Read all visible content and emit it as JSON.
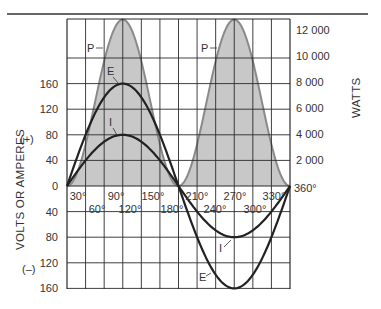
{
  "chart_data": {
    "type": "line",
    "title": "",
    "xlabel": "",
    "ylabel": "VOLTS OR AMPERES",
    "ylabel_right": "WATTS",
    "sign_labels": {
      "positive": "(+)",
      "negative": "(–)"
    },
    "x_unit": "°",
    "x": [
      0,
      30,
      60,
      90,
      120,
      150,
      180,
      210,
      240,
      270,
      300,
      330,
      360
    ],
    "x_tick_labels": [
      "30°",
      "60°",
      "90°",
      "120°",
      "150°",
      "180°",
      "210°",
      "240°",
      "270°",
      "300°",
      "330°",
      "360°"
    ],
    "xlim": [
      0,
      360
    ],
    "ylim_left": [
      -160,
      160
    ],
    "left_tick_labels_positive": [
      "160",
      "120",
      "80",
      "40",
      "0"
    ],
    "left_tick_labels_negative": [
      "40",
      "80",
      "120",
      "160"
    ],
    "ylim_right": [
      0,
      12800
    ],
    "right_tick_labels": [
      "12 000",
      "10 000",
      "8 000",
      "6 000",
      "4 000",
      "2 000"
    ],
    "grid": true,
    "series": [
      {
        "name": "E",
        "label": "E",
        "axis": "left",
        "peak": 160,
        "style": "black",
        "values": [
          0,
          80,
          138.6,
          160,
          138.6,
          80,
          0,
          -80,
          -138.6,
          -160,
          -138.6,
          -80,
          0
        ]
      },
      {
        "name": "I",
        "label": "I",
        "axis": "left",
        "peak": 80,
        "style": "black",
        "values": [
          0,
          40,
          69.3,
          80,
          69.3,
          40,
          0,
          -40,
          -69.3,
          -80,
          -69.3,
          -40,
          0
        ]
      },
      {
        "name": "P",
        "label": "P",
        "axis": "right",
        "peak": 12800,
        "style": "gray-filled",
        "values": [
          0,
          3200,
          9600,
          12800,
          9600,
          3200,
          0,
          3200,
          9600,
          12800,
          9600,
          3200,
          0
        ]
      }
    ],
    "colors": {
      "power_fill": "#c8c8c8",
      "power_stroke": "#8a8a8a",
      "curve": "#222222",
      "grid": "#2a2a2a"
    }
  }
}
